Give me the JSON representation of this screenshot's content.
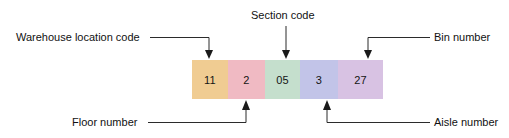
{
  "diagram": {
    "background_color": "#ffffff",
    "code_bar": {
      "segments": [
        {
          "value": "11",
          "color": "#f0cc92",
          "label": "Warehouse location code",
          "width": 36
        },
        {
          "value": "2",
          "color": "#f0bac3",
          "label": "Floor number",
          "width": 37
        },
        {
          "value": "05",
          "color": "#c5dfcd",
          "label": "Section code",
          "width": 35
        },
        {
          "value": "3",
          "color": "#c2c4e8",
          "label": "Aisle number",
          "width": 38
        },
        {
          "value": "27",
          "color": "#d8c2e3",
          "label": "Bin number",
          "width": 45
        }
      ]
    },
    "annotations": [
      {
        "name": "warehouse-location-code",
        "text": "Warehouse location code",
        "position": "top-left"
      },
      {
        "name": "section-code",
        "text": "Section code",
        "position": "top-center"
      },
      {
        "name": "bin-number",
        "text": "Bin number",
        "position": "top-right"
      },
      {
        "name": "floor-number",
        "text": "Floor number",
        "position": "bottom-left"
      },
      {
        "name": "aisle-number",
        "text": "Aisle number",
        "position": "bottom-right"
      }
    ]
  }
}
